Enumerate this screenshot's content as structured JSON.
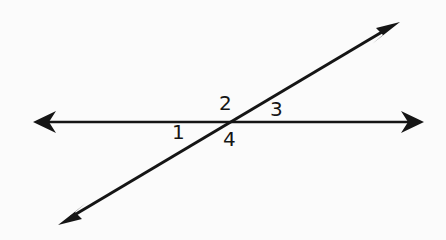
{
  "figure": {
    "kind": "geometry-diagram",
    "background_color": "#fbfbfb",
    "stroke_color": "#151515",
    "width": 446,
    "height": 240
  },
  "lines": [
    {
      "id": "horizontal-line",
      "name": "horizontal-line",
      "style": "double-headed-arrow",
      "x1": 33,
      "y1": 122,
      "x2": 424,
      "y2": 122,
      "stroke_width": 2.6
    },
    {
      "id": "diagonal-line",
      "name": "diagonal-line",
      "style": "double-headed-arrow",
      "x1": 58,
      "y1": 225,
      "x2": 400,
      "y2": 22,
      "stroke_width": 3.0
    }
  ],
  "intersection": {
    "name": "intersection-point",
    "x": 228,
    "y": 122
  },
  "arrowheads": [
    {
      "name": "arrowhead-left",
      "tip_x": 33,
      "tip_y": 122,
      "direction": "west"
    },
    {
      "name": "arrowhead-right",
      "tip_x": 424,
      "tip_y": 122,
      "direction": "east"
    },
    {
      "name": "arrowhead-upper-right",
      "tip_x": 400,
      "tip_y": 22,
      "direction": "northeast"
    },
    {
      "name": "arrowhead-lower-left",
      "tip_x": 58,
      "tip_y": 225,
      "direction": "southwest"
    }
  ],
  "angle_labels": [
    {
      "id": "1",
      "text": "1",
      "x": 179,
      "y": 132,
      "position": "below-left-of-intersection"
    },
    {
      "id": "2",
      "text": "2",
      "x": 226,
      "y": 103,
      "position": "above-left-of-intersection"
    },
    {
      "id": "3",
      "text": "3",
      "x": 277,
      "y": 109,
      "position": "above-right-of-intersection"
    },
    {
      "id": "4",
      "text": "4",
      "x": 230,
      "y": 139,
      "position": "below-right-of-intersection"
    }
  ]
}
